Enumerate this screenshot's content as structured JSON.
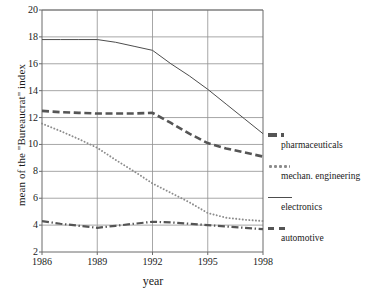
{
  "chart_data": {
    "type": "line",
    "title": "",
    "xlabel": "year",
    "ylabel": "mean of the \"Bureaucrat\" index",
    "x": [
      1986,
      1987,
      1988,
      1989,
      1990,
      1991,
      1992,
      1993,
      1994,
      1995,
      1996,
      1997,
      1998
    ],
    "xticks": [
      "1986",
      "1989",
      "1992",
      "1995",
      "1998"
    ],
    "xtickvalues": [
      1986,
      1989,
      1992,
      1995,
      1998
    ],
    "xlim": [
      1986,
      1998
    ],
    "yticks": [
      "2",
      "4",
      "6",
      "8",
      "10",
      "12",
      "14",
      "16",
      "18",
      "20"
    ],
    "ytickvalues": [
      2,
      4,
      6,
      8,
      10,
      12,
      14,
      16,
      18,
      20
    ],
    "ylim": [
      2,
      20
    ],
    "grid": "horizontal-and-vertical",
    "legend_position": "right",
    "series": [
      {
        "name": "pharmaceuticals",
        "style": "thick-dashed",
        "color": "#555555",
        "values": [
          12.5,
          12.4,
          12.35,
          12.3,
          12.3,
          12.3,
          12.35,
          11.6,
          10.8,
          10.1,
          9.7,
          9.4,
          9.1
        ]
      },
      {
        "name": "mechan. engineering",
        "style": "dotted",
        "color": "#8c8c8c",
        "values": [
          11.55,
          11.0,
          10.4,
          9.75,
          8.85,
          8.0,
          7.1,
          6.4,
          5.7,
          4.9,
          4.55,
          4.4,
          4.3
        ]
      },
      {
        "name": "electronics",
        "style": "solid-thin",
        "color": "#4d4d4d",
        "values": [
          17.8,
          17.8,
          17.8,
          17.8,
          17.6,
          17.3,
          17.0,
          16.0,
          15.1,
          14.1,
          13.0,
          11.9,
          10.8
        ]
      },
      {
        "name": "automotive",
        "style": "dash-dot",
        "color": "#555555",
        "values": [
          4.3,
          4.1,
          3.95,
          3.8,
          3.95,
          4.1,
          4.25,
          4.2,
          4.1,
          4.0,
          3.9,
          3.8,
          3.7
        ]
      }
    ]
  },
  "legend": {
    "entries": [
      {
        "label": "pharmaceuticals",
        "key": "thick-dashed-key-icon"
      },
      {
        "label": "mechan. engineering",
        "key": "dotted-key-icon"
      },
      {
        "label": "electronics",
        "key": "solid-line-key-icon"
      },
      {
        "label": "automotive",
        "key": "dash-dot-key-icon"
      }
    ]
  }
}
